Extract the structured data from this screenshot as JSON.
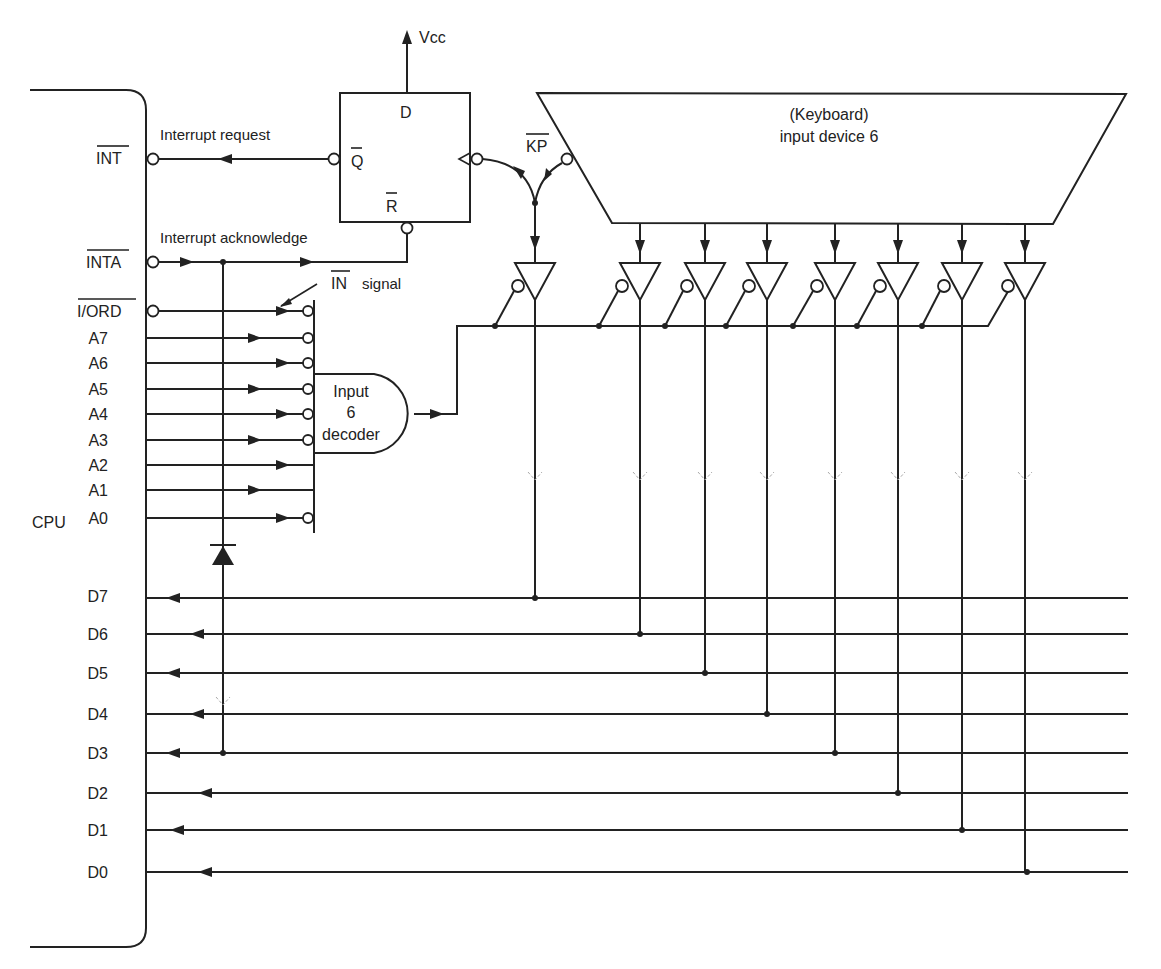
{
  "figure": {
    "cpu": {
      "label": "CPU",
      "control_pins": [
        {
          "name": "INT",
          "overbar": true
        },
        {
          "name": "INTA",
          "overbar": true
        },
        {
          "name": "I/ORD",
          "overbar": true
        }
      ],
      "address_pins": [
        "A7",
        "A6",
        "A5",
        "A4",
        "A3",
        "A2",
        "A1",
        "A0"
      ],
      "data_pins": [
        "D7",
        "D6",
        "D5",
        "D4",
        "D3",
        "D2",
        "D1",
        "D0"
      ]
    },
    "signals": {
      "interrupt_request": "Interrupt request",
      "interrupt_acknowledge": "Interrupt acknowledge",
      "in_signal_name": "IN",
      "in_signal_suffix": "signal",
      "vcc": "Vcc",
      "kp": "KP"
    },
    "flipflop": {
      "d": "D",
      "qbar": "Q",
      "rbar": "R"
    },
    "decoder": {
      "line1": "Input",
      "line2": "6",
      "line3": "decoder",
      "inverted_inputs": [
        "I/ORD",
        "A7",
        "A6",
        "A5",
        "A4",
        "A3",
        "A0"
      ],
      "direct_inputs": [
        "A2",
        "A1"
      ]
    },
    "keyboard": {
      "line1": "(Keyboard)",
      "line2": "input device 6"
    },
    "tristate_buffers": {
      "count": 8,
      "drives": [
        "D7",
        "D6",
        "D5",
        "D4",
        "D3",
        "D2",
        "D1",
        "D0"
      ]
    },
    "diode": {
      "connects": "INTA to D3"
    }
  }
}
